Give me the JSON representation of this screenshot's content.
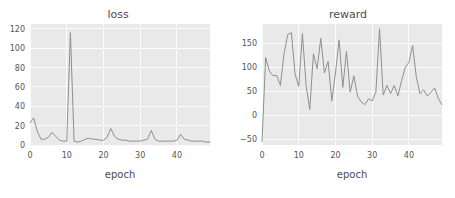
{
  "figure": {
    "background": "#ffffff",
    "plot_area_color": "#e9e9e9",
    "gridline_color": "#fcfcfc",
    "line_color": "#8f8f8f"
  },
  "chart_data": [
    {
      "type": "line",
      "title": "loss",
      "xlabel": "epoch",
      "ylabel": "",
      "xlim": [
        0,
        49
      ],
      "ylim": [
        0,
        125
      ],
      "xticks": [
        0,
        10,
        20,
        30,
        40
      ],
      "yticks": [
        0,
        20,
        40,
        60,
        80,
        100,
        120
      ],
      "grid": true,
      "legend": "none",
      "x": [
        0,
        1,
        2,
        3,
        4,
        5,
        6,
        7,
        8,
        9,
        10,
        11,
        12,
        13,
        14,
        15,
        16,
        17,
        18,
        19,
        20,
        21,
        22,
        23,
        24,
        25,
        26,
        27,
        28,
        29,
        30,
        31,
        32,
        33,
        34,
        35,
        36,
        37,
        38,
        39,
        40,
        41,
        42,
        43,
        44,
        45,
        46,
        47,
        48,
        49
      ],
      "values": [
        23,
        28,
        14,
        6,
        6,
        8,
        13,
        9,
        5,
        4,
        4,
        116,
        4,
        3,
        4,
        6,
        7,
        6,
        6,
        5,
        5,
        8,
        17,
        9,
        6,
        5,
        5,
        4,
        4,
        4,
        4,
        5,
        6,
        15,
        6,
        4,
        4,
        4,
        4,
        4,
        5,
        11,
        6,
        5,
        4,
        4,
        4,
        4,
        3,
        3
      ]
    },
    {
      "type": "line",
      "title": "reward",
      "xlabel": "epoch",
      "ylabel": "",
      "xlim": [
        0,
        49
      ],
      "ylim": [
        -62,
        190
      ],
      "xticks": [
        0,
        10,
        20,
        30,
        40
      ],
      "yticks": [
        -50,
        0,
        50,
        100,
        150
      ],
      "grid": true,
      "legend": "none",
      "x": [
        0,
        1,
        2,
        3,
        4,
        5,
        6,
        7,
        8,
        9,
        10,
        11,
        12,
        13,
        14,
        15,
        16,
        17,
        18,
        19,
        20,
        21,
        22,
        23,
        24,
        25,
        26,
        27,
        28,
        29,
        30,
        31,
        32,
        33,
        34,
        35,
        36,
        37,
        38,
        39,
        40,
        41,
        42,
        43,
        44,
        45,
        46,
        47,
        48,
        49
      ],
      "values": [
        -55,
        120,
        92,
        82,
        83,
        62,
        128,
        168,
        172,
        86,
        60,
        170,
        62,
        12,
        128,
        97,
        160,
        88,
        112,
        30,
        88,
        157,
        58,
        133,
        48,
        82,
        40,
        28,
        22,
        34,
        30,
        48,
        180,
        42,
        62,
        45,
        62,
        40,
        72,
        100,
        110,
        145,
        80,
        45,
        53,
        40,
        48,
        57,
        35,
        22
      ]
    }
  ]
}
